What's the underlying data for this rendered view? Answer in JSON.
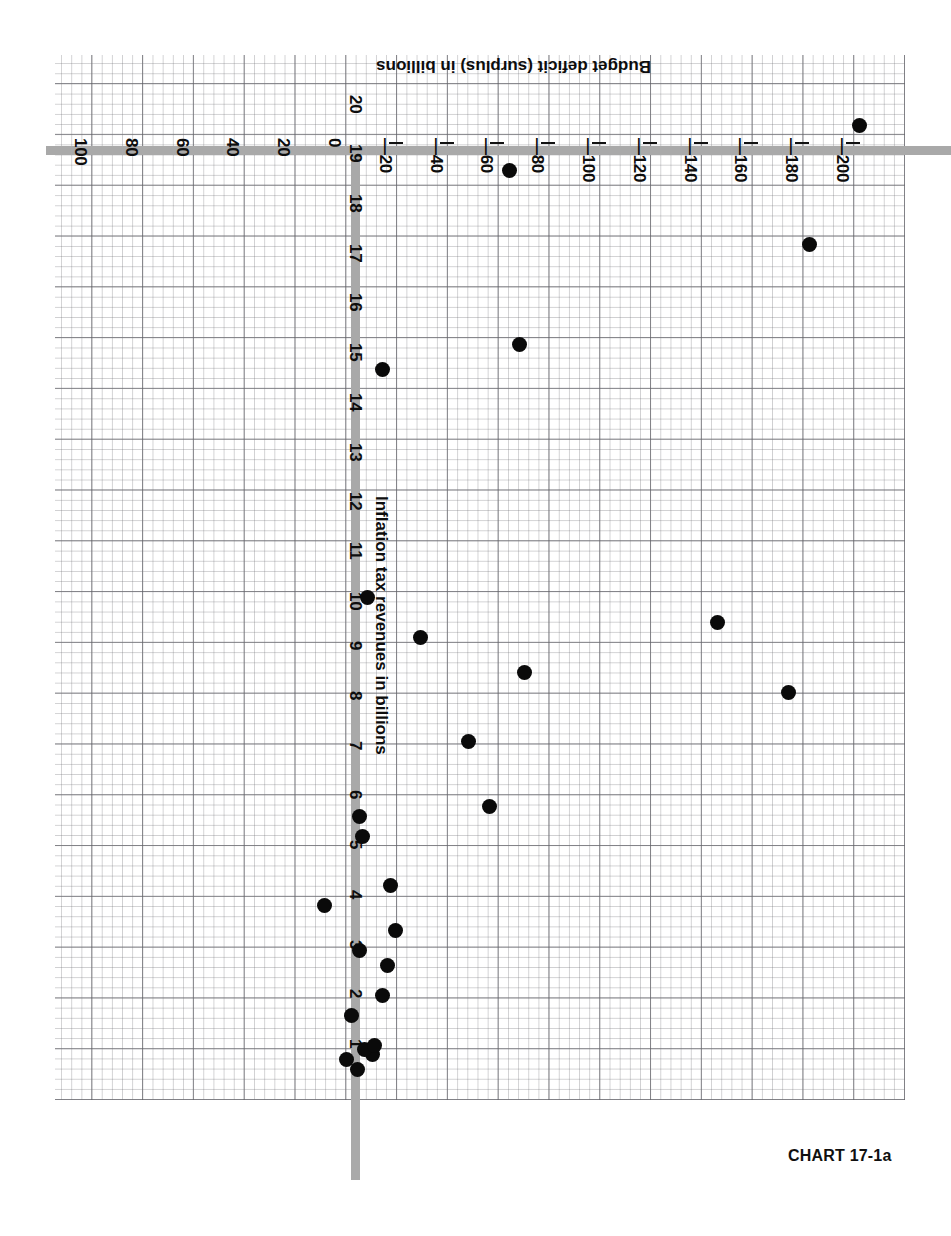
{
  "caption": "CHART 17-1a",
  "chart_data": {
    "type": "scatter",
    "title": "CHART 17-1a",
    "orientation": "page rotated 180 degrees (printed upside-down)",
    "grid": true,
    "legend": "none",
    "xlabel": "Inflation tax revenues in billions",
    "ylabel": "Budget deficit (surplus) in billions",
    "xlim": [
      0,
      20.5
    ],
    "ylim": [
      -205,
      110
    ],
    "x_ticks": [
      1,
      2,
      3,
      4,
      5,
      6,
      7,
      8,
      9,
      10,
      11,
      12,
      13,
      14,
      15,
      16,
      17,
      18,
      19,
      20
    ],
    "x_tick_labels": [
      "1",
      "2",
      "3",
      "4",
      "5",
      "6",
      "7",
      "8",
      "9",
      "10",
      "11",
      "12",
      "13",
      "14",
      "15",
      "16",
      "17",
      "18",
      "19",
      "20"
    ],
    "y_ticks": [
      100,
      80,
      60,
      40,
      20,
      0,
      -20,
      -40,
      -60,
      -80,
      -100,
      -120,
      -140,
      -160,
      -180,
      -200
    ],
    "y_tick_labels": [
      "100",
      "80",
      "60",
      "40",
      "20",
      "0",
      "—20",
      "—40",
      "—60",
      "—80",
      "—100",
      "—120",
      "—140",
      "—160",
      "—180",
      "—200"
    ],
    "marker": "filled-circle",
    "marker_color": "#0a0a0a",
    "axis_color": "#a9a9a9",
    "grid_color": "#78787d",
    "points": [
      {
        "x": 0.6,
        "y": -2
      },
      {
        "x": 0.8,
        "y": 2
      },
      {
        "x": 0.9,
        "y": -8
      },
      {
        "x": 1.0,
        "y": -5
      },
      {
        "x": 1.1,
        "y": -9
      },
      {
        "x": 1.7,
        "y": 0
      },
      {
        "x": 2.1,
        "y": -12
      },
      {
        "x": 2.7,
        "y": -14
      },
      {
        "x": 3.0,
        "y": -3
      },
      {
        "x": 3.4,
        "y": -17
      },
      {
        "x": 3.9,
        "y": 11
      },
      {
        "x": 4.3,
        "y": -15
      },
      {
        "x": 5.3,
        "y": -4
      },
      {
        "x": 5.7,
        "y": -3
      },
      {
        "x": 5.9,
        "y": -54
      },
      {
        "x": 7.2,
        "y": -46
      },
      {
        "x": 8.2,
        "y": -172
      },
      {
        "x": 8.6,
        "y": -68
      },
      {
        "x": 9.3,
        "y": -27
      },
      {
        "x": 9.6,
        "y": -144
      },
      {
        "x": 10.1,
        "y": -6
      },
      {
        "x": 14.7,
        "y": -12
      },
      {
        "x": 15.2,
        "y": -66
      },
      {
        "x": 17.2,
        "y": -180
      },
      {
        "x": 18.7,
        "y": -62
      },
      {
        "x": 19.6,
        "y": -200
      }
    ]
  },
  "axis": {
    "x_title": "Inflation tax revenues in billions",
    "y_title": "Budget deficit (surplus) in billions"
  }
}
